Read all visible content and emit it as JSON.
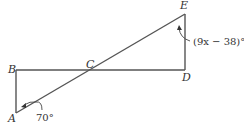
{
  "diagram": {
    "points": {
      "A": {
        "label": "A",
        "x": 16,
        "y": 113
      },
      "B": {
        "label": "B",
        "x": 16,
        "y": 70
      },
      "C": {
        "label": "C",
        "x": 91,
        "y": 70
      },
      "D": {
        "label": "D",
        "x": 185,
        "y": 70
      },
      "E": {
        "label": "E",
        "x": 185,
        "y": 14
      }
    },
    "segments": [
      "AB",
      "BD",
      "DE",
      "AE"
    ],
    "angles": {
      "at_A": "70°",
      "at_E": "(9x − 38)°"
    }
  }
}
